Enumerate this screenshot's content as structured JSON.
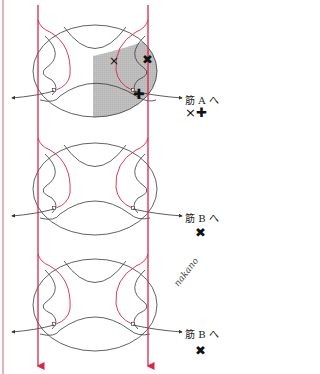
{
  "colors": {
    "red_line": "#d6284a",
    "pink_border": "#e89aa8",
    "oval_stroke": "#3a3a3a",
    "shade": "#bdbdbd"
  },
  "units": [
    {
      "id": "unit-1",
      "target_label": "筋 A へ",
      "marks": "×✚",
      "shaded": true
    },
    {
      "id": "unit-2",
      "target_label": "筋 B へ",
      "marks": "✖",
      "shaded": false
    },
    {
      "id": "unit-3",
      "target_label": "筋 B へ",
      "marks": "✖",
      "shaded": false
    }
  ],
  "inner_marks": {
    "thin_x": "×",
    "bold_x": "✖",
    "bold_plus": "✚"
  },
  "signature": "nakano"
}
